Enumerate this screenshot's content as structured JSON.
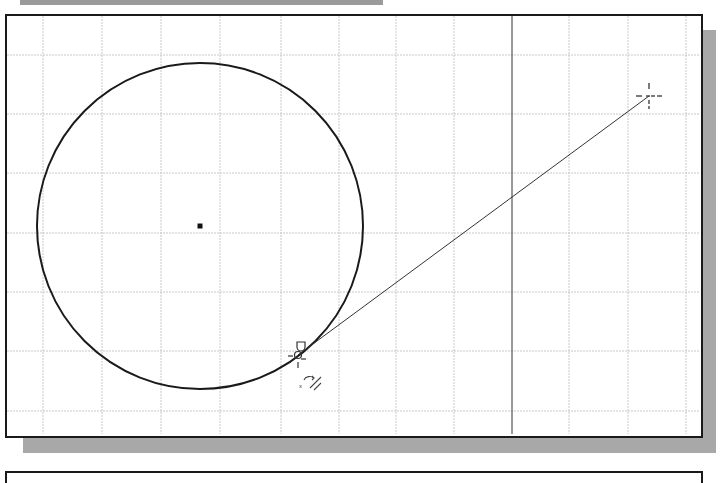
{
  "app": {
    "type": "CAD drawing area",
    "background": "#ffffff"
  },
  "drawing": {
    "grid": {
      "color": "#c8c8c8",
      "vertical_lines_x": [
        43,
        102,
        161,
        220,
        281,
        339,
        396,
        454,
        569,
        628,
        686
      ],
      "horizontal_lines_y": [
        55,
        114,
        173,
        233,
        292,
        351,
        411
      ]
    },
    "axis_line": {
      "x": 512,
      "color": "#333333"
    },
    "circle": {
      "cx": 200,
      "cy": 226,
      "r": 163,
      "stroke": "#1a1a1a",
      "stroke_width": 2
    },
    "center_point": {
      "x": 200,
      "y": 226
    },
    "tangent_line": {
      "x1": 298,
      "y1": 355,
      "x2": 649,
      "y2": 96,
      "stroke": "#333333"
    },
    "cursor_crosshair": {
      "x": 649,
      "y": 96
    },
    "tangent_snap_marker": {
      "x": 298,
      "y": 355,
      "label": "Tangent"
    },
    "rotate_glyph": {
      "x": 308,
      "y": 380
    }
  }
}
